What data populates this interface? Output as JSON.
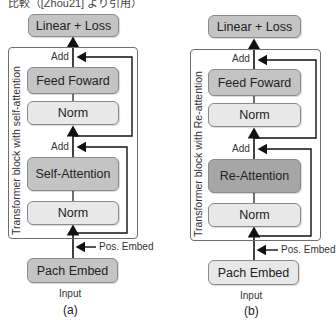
{
  "header": {
    "caption": "比較（[Zhou21] より引用）"
  },
  "panels": [
    {
      "id": "a",
      "sublabel": "(a)",
      "frame_label": "Transformer block with self-attention",
      "output_box": "Linear + Loss",
      "feed_forward": "Feed Foward",
      "norm_top": "Norm",
      "attention": "Self-Attention",
      "norm_bottom": "Norm",
      "embed": "Pach Embed",
      "input": "Input",
      "pos_embed": "Pos. Embed",
      "add_top": "Add",
      "add_bottom": "Add"
    },
    {
      "id": "b",
      "sublabel": "(b)",
      "frame_label": "Transformer block with Re-attention",
      "output_box": "Linear + Loss",
      "feed_forward": "Feed Foward",
      "norm_top": "Norm",
      "attention": "Re-Attention",
      "norm_bottom": "Norm",
      "embed": "Pach Embed",
      "input": "Input",
      "pos_embed": "Pos. Embed",
      "add_top": "Add",
      "add_bottom": "Add"
    }
  ],
  "colors": {
    "light_box": "#e8e8e8",
    "mid_box": "#c4c4c4",
    "re_attention_box": "#a6a6a6",
    "line": "#222222"
  }
}
